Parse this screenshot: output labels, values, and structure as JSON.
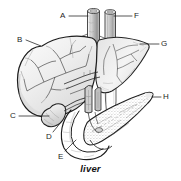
{
  "figure": {
    "title": "liver",
    "caption": "liver",
    "type": "anatomical-line-illustration",
    "subject": "liver",
    "background_color": "#ffffff",
    "ink_color": "#1d1d1d",
    "shading_color": "#8c8c8c"
  },
  "labels": [
    {
      "id": "A",
      "text": "A",
      "x": 60,
      "y": 12,
      "side": "left",
      "leader": {
        "x1": 69,
        "y1": 16,
        "x2": 88,
        "y2": 16
      },
      "target": "left-vessel-stump-top"
    },
    {
      "id": "B",
      "text": "B",
      "x": 17,
      "y": 36,
      "side": "left",
      "leader": {
        "x1": 26,
        "y1": 40,
        "x2": 41,
        "y2": 46
      },
      "target": "liver-left-lobe-superior-border"
    },
    {
      "id": "C",
      "text": "C",
      "x": 10,
      "y": 112,
      "side": "left",
      "leader": {
        "x1": 19,
        "y1": 116,
        "x2": 49,
        "y2": 116
      },
      "target": "gallbladder-fundus"
    },
    {
      "id": "D",
      "text": "D",
      "x": 46,
      "y": 133,
      "side": "left",
      "leader": {
        "x1": 53,
        "y1": 132,
        "x2": 62,
        "y2": 121
      },
      "target": "cystic-bile-duct"
    },
    {
      "id": "E",
      "text": "E",
      "x": 58,
      "y": 153,
      "side": "left",
      "leader": {
        "x1": 65,
        "y1": 151,
        "x2": 76,
        "y2": 140
      },
      "target": "duodenum"
    },
    {
      "id": "F",
      "text": "F",
      "x": 134,
      "y": 12,
      "side": "right",
      "leader": {
        "x1": 132,
        "y1": 16,
        "x2": 114,
        "y2": 16
      },
      "target": "right-vessel-stump-top"
    },
    {
      "id": "G",
      "text": "G",
      "x": 161,
      "y": 40,
      "side": "right",
      "leader": {
        "x1": 159,
        "y1": 44,
        "x2": 140,
        "y2": 44
      },
      "target": "liver-right-lobe"
    },
    {
      "id": "H",
      "text": "H",
      "x": 163,
      "y": 93,
      "side": "right",
      "leader": {
        "x1": 161,
        "y1": 97,
        "x2": 152,
        "y2": 97
      },
      "target": "pancreas-tail"
    }
  ],
  "structures": [
    {
      "name": "liver",
      "label_id": "B"
    },
    {
      "name": "liver-right-lobe",
      "label_id": "G"
    },
    {
      "name": "vessel-stump-left",
      "label_id": "A"
    },
    {
      "name": "vessel-stump-right",
      "label_id": "F"
    },
    {
      "name": "gallbladder",
      "label_id": "C"
    },
    {
      "name": "bile-duct",
      "label_id": "D"
    },
    {
      "name": "duodenum",
      "label_id": "E"
    },
    {
      "name": "pancreas",
      "label_id": "H"
    }
  ]
}
